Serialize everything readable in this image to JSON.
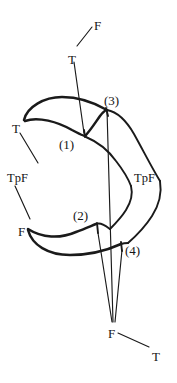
{
  "figure": {
    "background_color": "#ffffff",
    "ink_color": "#1a1a1a",
    "width": 177,
    "height": 383,
    "labels": [
      {
        "id": "f-top",
        "text": "F",
        "x": 94,
        "y": 19,
        "kind": "letter"
      },
      {
        "id": "t-top",
        "text": "T",
        "x": 68,
        "y": 53,
        "kind": "letter"
      },
      {
        "id": "t-left",
        "text": "T",
        "x": 12,
        "y": 122,
        "kind": "letter"
      },
      {
        "id": "tpf-left",
        "text": "TpF",
        "x": 7,
        "y": 172,
        "kind": "tpf"
      },
      {
        "id": "f-left",
        "text": "F",
        "x": 18,
        "y": 225,
        "kind": "letter"
      },
      {
        "id": "tpf-right",
        "text": "TpF",
        "x": 134,
        "y": 172,
        "kind": "tpf"
      },
      {
        "id": "num-1",
        "text": "(1)",
        "x": 59,
        "y": 138,
        "kind": "number"
      },
      {
        "id": "num-2",
        "text": "(2)",
        "x": 73,
        "y": 209,
        "kind": "number"
      },
      {
        "id": "num-3",
        "text": "(3)",
        "x": 104,
        "y": 94,
        "kind": "number"
      },
      {
        "id": "num-4",
        "text": "(4)",
        "x": 125,
        "y": 244,
        "kind": "number"
      },
      {
        "id": "f-bottom",
        "text": "F",
        "x": 108,
        "y": 327,
        "kind": "letter"
      },
      {
        "id": "t-bottom",
        "text": "T",
        "x": 152,
        "y": 350,
        "kind": "letter"
      }
    ],
    "leader_lines": [
      {
        "id": "leader-f-top-to-t-top",
        "from": [
          93,
          26
        ],
        "to": [
          76,
          47
        ]
      },
      {
        "id": "leader-t-top-to-cusp1",
        "from": [
          74,
          62
        ],
        "to": [
          84,
          135
        ]
      },
      {
        "id": "leader-t-left-to-body",
        "from": [
          19,
          133
        ],
        "to": [
          36,
          163
        ]
      },
      {
        "id": "leader-tpf-left-to-f",
        "from": [
          15,
          185
        ],
        "to": [
          29,
          218
        ]
      },
      {
        "id": "leader-f-bottom-to-t",
        "from": [
          117,
          333
        ],
        "to": [
          150,
          347
        ]
      }
    ],
    "long_lines": [
      {
        "id": "long-line-cusp3-to-F",
        "from": [
          107,
          110
        ],
        "to": [
          113,
          325
        ]
      },
      {
        "id": "long-line-cusp2-to-F",
        "from": [
          98,
          234
        ],
        "to": [
          112,
          325
        ]
      },
      {
        "id": "long-line-cusp4-to-F",
        "from": [
          122,
          250
        ],
        "to": [
          115,
          325
        ]
      }
    ],
    "curves": [
      {
        "id": "upper-outer-arc",
        "weight": "thick"
      },
      {
        "id": "upper-inner-arc",
        "weight": "thick"
      },
      {
        "id": "right-outer-s",
        "weight": "med"
      },
      {
        "id": "right-inner-s",
        "weight": "med"
      },
      {
        "id": "lower-outer-arc",
        "weight": "thick"
      },
      {
        "id": "lower-inner-arc",
        "weight": "thick"
      },
      {
        "id": "cusp-1-tick",
        "weight": "med"
      },
      {
        "id": "cusp-2-tick",
        "weight": "med"
      },
      {
        "id": "cusp-3-tick",
        "weight": "med"
      },
      {
        "id": "cusp-4-tick",
        "weight": "med"
      }
    ]
  }
}
